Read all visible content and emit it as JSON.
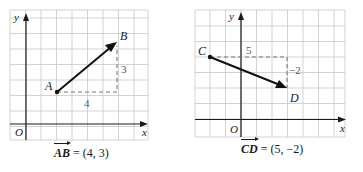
{
  "diagrams": [
    {
      "id": "left",
      "grid": {
        "x0": 10,
        "y0": 10,
        "cols": 9,
        "rows": 8.5,
        "cell": 15.3,
        "origin_col": 1,
        "origin_row_from_bottom": 1
      },
      "axis_labels": {
        "x": "x",
        "y": "y",
        "origin": "O"
      },
      "points": [
        {
          "label": "A",
          "x": 2,
          "y": 2
        },
        {
          "label": "B",
          "x": 6,
          "y": 5
        }
      ],
      "components": {
        "dx": "4",
        "dy": "3"
      },
      "caption": {
        "vector": "AB",
        "equals": " = (4, 3)"
      }
    },
    {
      "id": "right",
      "grid": {
        "x0": 195,
        "y0": 10,
        "cols": 9.8,
        "rows": 8.3,
        "cell": 15.3,
        "origin_col": 3,
        "origin_row_from_bottom": 1
      },
      "axis_labels": {
        "x": "x",
        "y": "y",
        "origin": "O"
      },
      "points": [
        {
          "label": "C",
          "x": -2,
          "y": 4
        },
        {
          "label": "D",
          "x": 3,
          "y": 2
        }
      ],
      "components": {
        "dx": "5",
        "dy": "−2"
      },
      "caption": {
        "vector": "CD",
        "equals": " = (5, −2)"
      }
    }
  ],
  "colors": {
    "grid": "#c8c8c8",
    "axis": "#1a1a1a",
    "vector": "#111111",
    "dashed": "#777777",
    "label": "#1a1a1a",
    "component_label": "#555555"
  }
}
